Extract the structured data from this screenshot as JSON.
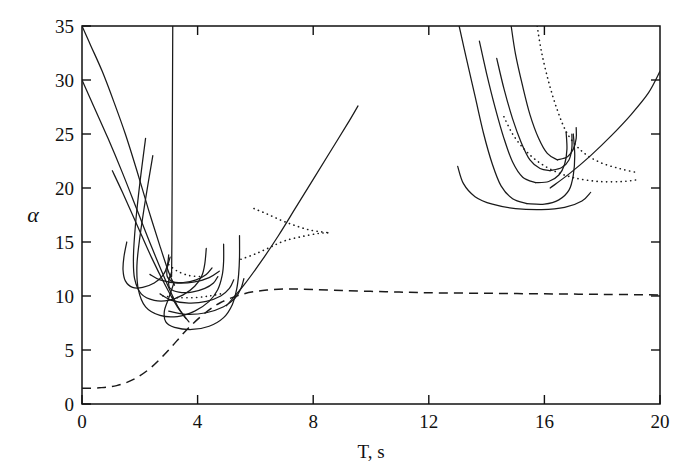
{
  "chart_data": {
    "type": "line",
    "title": "",
    "xlabel": "T, s",
    "ylabel": "α",
    "xlim": [
      0,
      20
    ],
    "ylim": [
      0,
      35
    ],
    "xticks": [
      0,
      4,
      8,
      12,
      16,
      20
    ],
    "yticks": [
      0,
      5,
      10,
      15,
      20,
      25,
      30,
      35
    ],
    "xtick_labels": [
      "0",
      "4",
      "8",
      "12",
      "16",
      "20"
    ],
    "ytick_labels": [
      "0",
      "5",
      "10",
      "15",
      "20",
      "25",
      "30",
      "35"
    ],
    "grid": false,
    "legend": "none",
    "series": [
      {
        "name": "descending-branch-1",
        "style": "solid",
        "points": [
          [
            0.0,
            35.0
          ],
          [
            0.3,
            33.2
          ],
          [
            0.7,
            30.8
          ],
          [
            1.1,
            28.0
          ],
          [
            1.5,
            25.0
          ],
          [
            1.9,
            21.6
          ],
          [
            2.3,
            18.0
          ],
          [
            2.7,
            14.6
          ],
          [
            3.0,
            12.2
          ],
          [
            3.2,
            11.0
          ]
        ]
      },
      {
        "name": "descending-branch-2",
        "style": "solid",
        "points": [
          [
            0.0,
            30.0
          ],
          [
            0.4,
            27.6
          ],
          [
            0.9,
            24.6
          ],
          [
            1.4,
            21.4
          ],
          [
            1.9,
            18.0
          ],
          [
            2.4,
            14.6
          ],
          [
            2.9,
            11.4
          ],
          [
            3.3,
            9.1
          ],
          [
            3.6,
            7.9
          ]
        ]
      },
      {
        "name": "descending-branch-3",
        "style": "solid",
        "points": [
          [
            1.05,
            21.6
          ],
          [
            1.4,
            19.6
          ],
          [
            1.9,
            16.6
          ],
          [
            2.4,
            13.6
          ],
          [
            2.9,
            10.9
          ],
          [
            3.3,
            9.0
          ],
          [
            3.7,
            7.6
          ]
        ]
      },
      {
        "name": "vertical-spike",
        "style": "solid",
        "points": [
          [
            3.14,
            35.0
          ],
          [
            3.13,
            28.0
          ],
          [
            3.12,
            21.0
          ],
          [
            3.11,
            15.0
          ],
          [
            3.1,
            11.8
          ]
        ]
      },
      {
        "name": "loop-outer",
        "style": "solid",
        "points": [
          [
            3.18,
            11.2
          ],
          [
            3.0,
            9.8
          ],
          [
            2.85,
            8.6
          ],
          [
            2.9,
            7.6
          ],
          [
            3.2,
            7.1
          ],
          [
            3.8,
            6.9
          ],
          [
            4.4,
            7.2
          ],
          [
            4.9,
            8.0
          ],
          [
            5.2,
            9.2
          ],
          [
            5.35,
            10.6
          ],
          [
            5.42,
            12.0
          ],
          [
            5.45,
            13.6
          ],
          [
            5.45,
            15.6
          ]
        ]
      },
      {
        "name": "loop-mid",
        "style": "solid",
        "points": [
          [
            2.45,
            23.0
          ],
          [
            2.2,
            19.0
          ],
          [
            2.0,
            15.4
          ],
          [
            1.9,
            12.8
          ],
          [
            1.95,
            10.6
          ],
          [
            2.2,
            9.0
          ],
          [
            2.7,
            8.2
          ],
          [
            3.3,
            8.1
          ],
          [
            3.9,
            8.6
          ],
          [
            4.4,
            9.5
          ],
          [
            4.7,
            10.6
          ],
          [
            4.85,
            11.9
          ],
          [
            4.9,
            13.2
          ],
          [
            4.9,
            14.8
          ]
        ]
      },
      {
        "name": "loop-inner",
        "style": "solid",
        "points": [
          [
            2.2,
            24.6
          ],
          [
            2.0,
            20.4
          ],
          [
            1.85,
            16.6
          ],
          [
            1.78,
            13.6
          ],
          [
            1.82,
            11.6
          ],
          [
            2.05,
            10.2
          ],
          [
            2.5,
            9.6
          ],
          [
            3.0,
            9.6
          ],
          [
            3.5,
            10.1
          ],
          [
            3.9,
            10.9
          ],
          [
            4.15,
            11.9
          ],
          [
            4.25,
            13.0
          ],
          [
            4.3,
            14.4
          ]
        ]
      },
      {
        "name": "loop-small-left",
        "style": "solid",
        "points": [
          [
            1.55,
            15.0
          ],
          [
            1.45,
            13.6
          ],
          [
            1.42,
            12.4
          ],
          [
            1.5,
            11.4
          ],
          [
            1.75,
            10.8
          ],
          [
            2.1,
            10.8
          ],
          [
            2.5,
            11.2
          ],
          [
            2.8,
            11.9
          ],
          [
            2.95,
            12.8
          ],
          [
            3.0,
            13.8
          ]
        ]
      },
      {
        "name": "hook-inner-a",
        "style": "solid",
        "points": [
          [
            3.05,
            13.6
          ],
          [
            2.95,
            12.6
          ],
          [
            2.95,
            11.8
          ],
          [
            3.15,
            11.3
          ],
          [
            3.5,
            11.25
          ],
          [
            3.95,
            11.5
          ],
          [
            4.3,
            12.0
          ],
          [
            4.5,
            12.6
          ]
        ]
      },
      {
        "name": "hook-inner-b",
        "style": "solid",
        "points": [
          [
            3.1,
            12.2
          ],
          [
            3.0,
            11.4
          ],
          [
            3.05,
            10.7
          ],
          [
            3.35,
            10.35
          ],
          [
            3.8,
            10.35
          ],
          [
            4.25,
            10.7
          ],
          [
            4.55,
            11.2
          ],
          [
            4.7,
            11.8
          ]
        ]
      },
      {
        "name": "tail-lower-a",
        "style": "solid",
        "points": [
          [
            2.7,
            10.2
          ],
          [
            3.1,
            9.6
          ],
          [
            3.7,
            9.35
          ],
          [
            4.3,
            9.5
          ],
          [
            4.8,
            10.0
          ],
          [
            5.1,
            10.7
          ],
          [
            5.25,
            11.5
          ]
        ]
      },
      {
        "name": "tail-lower-b",
        "style": "solid",
        "points": [
          [
            3.0,
            8.6
          ],
          [
            3.6,
            8.3
          ],
          [
            4.3,
            8.45
          ],
          [
            4.9,
            9.0
          ],
          [
            5.3,
            9.8
          ],
          [
            5.5,
            10.7
          ],
          [
            5.6,
            11.6
          ]
        ]
      },
      {
        "name": "tail-lower-c",
        "style": "solid",
        "points": [
          [
            2.35,
            12.0
          ],
          [
            2.7,
            11.5
          ],
          [
            3.3,
            11.2
          ],
          [
            3.9,
            11.3
          ],
          [
            4.4,
            11.7
          ],
          [
            4.75,
            12.3
          ]
        ]
      },
      {
        "name": "rising-branch-mid",
        "style": "solid",
        "points": [
          [
            5.0,
            9.1
          ],
          [
            5.6,
            11.0
          ],
          [
            6.2,
            13.2
          ],
          [
            6.8,
            15.6
          ],
          [
            7.4,
            18.2
          ],
          [
            8.0,
            20.8
          ],
          [
            8.6,
            23.4
          ],
          [
            9.2,
            26.0
          ],
          [
            9.55,
            27.6
          ]
        ]
      },
      {
        "name": "dotted-fishtail-upper",
        "style": "dotted",
        "points": [
          [
            5.95,
            18.1
          ],
          [
            6.4,
            17.6
          ],
          [
            6.9,
            17.0
          ],
          [
            7.4,
            16.5
          ],
          [
            7.9,
            16.1
          ],
          [
            8.4,
            15.9
          ],
          [
            8.6,
            15.85
          ]
        ]
      },
      {
        "name": "dotted-fishtail-lower",
        "style": "dotted",
        "points": [
          [
            5.5,
            13.4
          ],
          [
            6.0,
            13.9
          ],
          [
            6.5,
            14.5
          ],
          [
            7.0,
            15.1
          ],
          [
            7.6,
            15.5
          ],
          [
            8.2,
            15.8
          ],
          [
            8.6,
            15.85
          ]
        ]
      },
      {
        "name": "dotted-short-left",
        "style": "dotted",
        "points": [
          [
            3.0,
            12.9
          ],
          [
            3.3,
            12.3
          ],
          [
            3.7,
            11.9
          ],
          [
            4.1,
            11.8
          ]
        ]
      },
      {
        "name": "dotted-short-flat",
        "style": "dotted",
        "points": [
          [
            2.8,
            10.0
          ],
          [
            3.3,
            9.85
          ],
          [
            3.9,
            9.85
          ],
          [
            4.4,
            10.0
          ],
          [
            4.8,
            10.2
          ]
        ]
      },
      {
        "name": "hairpin-1-left",
        "style": "solid",
        "points": [
          [
            13.05,
            35.0
          ],
          [
            13.3,
            32.0
          ],
          [
            13.6,
            28.5
          ],
          [
            13.9,
            25.0
          ],
          [
            14.2,
            22.2
          ],
          [
            14.5,
            20.2
          ],
          [
            14.9,
            19.0
          ],
          [
            15.4,
            18.55
          ]
        ]
      },
      {
        "name": "hairpin-1-right",
        "style": "solid",
        "points": [
          [
            15.4,
            18.55
          ],
          [
            16.0,
            18.5
          ],
          [
            16.5,
            18.9
          ],
          [
            16.85,
            19.8
          ],
          [
            17.0,
            21.2
          ],
          [
            17.05,
            23.0
          ],
          [
            17.0,
            25.0
          ]
        ]
      },
      {
        "name": "hairpin-2-left",
        "style": "solid",
        "points": [
          [
            13.75,
            33.6
          ],
          [
            14.0,
            30.6
          ],
          [
            14.3,
            27.4
          ],
          [
            14.6,
            24.6
          ],
          [
            14.9,
            22.4
          ],
          [
            15.25,
            21.0
          ],
          [
            15.7,
            20.5
          ]
        ]
      },
      {
        "name": "hairpin-2-right",
        "style": "solid",
        "points": [
          [
            15.7,
            20.5
          ],
          [
            16.15,
            20.6
          ],
          [
            16.5,
            21.2
          ],
          [
            16.7,
            22.2
          ],
          [
            16.78,
            23.6
          ],
          [
            16.75,
            25.2
          ]
        ]
      },
      {
        "name": "hairpin-3-left",
        "style": "solid",
        "points": [
          [
            14.35,
            32.0
          ],
          [
            14.6,
            29.2
          ],
          [
            14.9,
            26.4
          ],
          [
            15.2,
            24.2
          ],
          [
            15.5,
            22.6
          ],
          [
            15.85,
            21.8
          ],
          [
            16.2,
            21.6
          ]
        ]
      },
      {
        "name": "hairpin-3-right",
        "style": "solid",
        "points": [
          [
            16.2,
            21.6
          ],
          [
            16.6,
            21.9
          ],
          [
            16.85,
            22.6
          ],
          [
            16.95,
            23.7
          ],
          [
            16.95,
            25.0
          ]
        ]
      },
      {
        "name": "hairpin-4-left",
        "style": "solid",
        "points": [
          [
            14.85,
            35.0
          ],
          [
            15.0,
            32.4
          ],
          [
            15.25,
            29.4
          ],
          [
            15.5,
            26.8
          ],
          [
            15.8,
            24.6
          ],
          [
            16.1,
            23.2
          ],
          [
            16.45,
            22.6
          ]
        ]
      },
      {
        "name": "hairpin-4-right",
        "style": "solid",
        "points": [
          [
            16.45,
            22.6
          ],
          [
            16.8,
            22.9
          ],
          [
            17.0,
            23.6
          ],
          [
            17.1,
            24.6
          ],
          [
            17.1,
            25.6
          ]
        ]
      },
      {
        "name": "hairpin-outer-bottom",
        "style": "solid",
        "points": [
          [
            13.0,
            22.0
          ],
          [
            13.2,
            20.4
          ],
          [
            13.6,
            19.2
          ],
          [
            14.2,
            18.5
          ],
          [
            15.0,
            18.1
          ],
          [
            15.9,
            18.0
          ],
          [
            16.7,
            18.2
          ],
          [
            17.3,
            18.8
          ],
          [
            17.6,
            19.6
          ]
        ]
      },
      {
        "name": "dotted-right-descending",
        "style": "dotted",
        "points": [
          [
            15.75,
            35.0
          ],
          [
            15.9,
            32.6
          ],
          [
            16.15,
            29.8
          ],
          [
            16.45,
            27.2
          ],
          [
            16.8,
            25.0
          ],
          [
            17.3,
            23.4
          ],
          [
            17.9,
            22.4
          ],
          [
            18.6,
            21.8
          ],
          [
            19.25,
            21.4
          ]
        ]
      },
      {
        "name": "dotted-right-upper",
        "style": "dotted",
        "points": [
          [
            14.6,
            26.6
          ],
          [
            14.9,
            25.0
          ],
          [
            15.3,
            23.6
          ],
          [
            15.8,
            22.4
          ],
          [
            16.4,
            21.5
          ],
          [
            17.1,
            20.9
          ],
          [
            17.9,
            20.6
          ],
          [
            18.7,
            20.6
          ],
          [
            19.3,
            20.8
          ]
        ]
      },
      {
        "name": "rising-branch-right",
        "style": "solid",
        "points": [
          [
            16.2,
            20.0
          ],
          [
            16.9,
            21.4
          ],
          [
            17.6,
            23.0
          ],
          [
            18.3,
            24.8
          ],
          [
            19.0,
            26.8
          ],
          [
            19.6,
            28.8
          ],
          [
            20.0,
            30.8
          ]
        ]
      },
      {
        "name": "dashed-sigmoid",
        "style": "dashed",
        "points": [
          [
            0.0,
            1.45
          ],
          [
            0.6,
            1.5
          ],
          [
            1.2,
            1.7
          ],
          [
            1.8,
            2.3
          ],
          [
            2.4,
            3.4
          ],
          [
            3.0,
            5.0
          ],
          [
            3.6,
            6.8
          ],
          [
            4.2,
            8.3
          ],
          [
            4.8,
            9.4
          ],
          [
            5.6,
            10.2
          ],
          [
            6.4,
            10.55
          ],
          [
            7.2,
            10.65
          ],
          [
            8.0,
            10.6
          ],
          [
            9.0,
            10.5
          ],
          [
            10.5,
            10.4
          ],
          [
            12.0,
            10.3
          ],
          [
            14.0,
            10.25
          ],
          [
            16.0,
            10.2
          ],
          [
            18.0,
            10.15
          ],
          [
            20.0,
            10.1
          ]
        ]
      }
    ]
  },
  "axes": {
    "x_label": "T, s",
    "y_label": "α"
  }
}
